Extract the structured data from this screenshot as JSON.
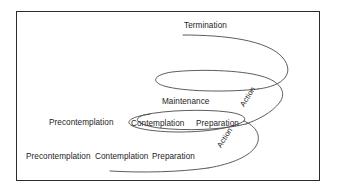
{
  "diagram": {
    "title_visible": false,
    "type": "spiral-model-of-change",
    "frame": {
      "border_color": "#2c2c2c",
      "background": "#ffffff"
    },
    "stroke_color": "#4a4a4a",
    "text_color": "#1d1d1d",
    "labels": {
      "termination": "Termination",
      "maintenance": "Maintenance",
      "precontemplation_middle": "Precontemplation",
      "contemplation_middle": "Contemplation",
      "preparation_middle": "Preparation",
      "precontemplation_bottom": "Precontemplation",
      "contemplation_bottom": "Contemplation",
      "preparation_bottom": "Preparation",
      "action_upper": "Action",
      "action_lower": "Action"
    },
    "levels": [
      {
        "name": "top-level",
        "stages": [
          "Termination"
        ]
      },
      {
        "name": "middle-level",
        "stages": [
          "Precontemplation",
          "Contemplation",
          "Preparation",
          "Action",
          "Maintenance"
        ]
      },
      {
        "name": "bottom-level",
        "stages": [
          "Precontemplation",
          "Contemplation",
          "Preparation",
          "Action"
        ]
      }
    ]
  }
}
